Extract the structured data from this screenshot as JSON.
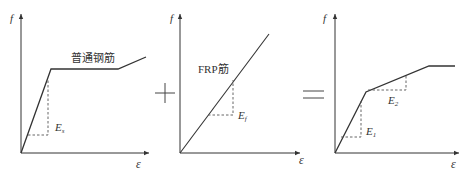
{
  "diagram": {
    "colors": {
      "line": "#333333",
      "dash": "#555555",
      "background": "#ffffff"
    },
    "panels": [
      {
        "id": "steel",
        "y_axis_label": "f",
        "x_axis_label": "ε",
        "curve_label": "普通钢筋",
        "modulus_label": "E",
        "modulus_sub": "s"
      },
      {
        "id": "frp",
        "y_axis_label": "f",
        "x_axis_label": "ε",
        "curve_label": "FRP筋",
        "modulus_label": "E",
        "modulus_sub": "f"
      },
      {
        "id": "hybrid",
        "y_axis_label": "f",
        "x_axis_label": "ε",
        "modulus1_label": "E",
        "modulus1_sub": "1",
        "modulus2_label": "E",
        "modulus2_sub": "2"
      }
    ],
    "operators": {
      "plus": "+",
      "equals": "="
    }
  }
}
